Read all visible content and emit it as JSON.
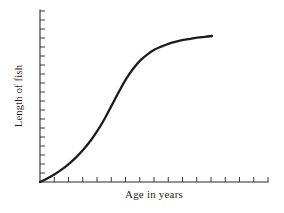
{
  "chart_data": {
    "type": "line",
    "title": "",
    "subtitle": "",
    "xlabel": "Age in years",
    "ylabel": "Length of fish",
    "grid": false,
    "legend": false,
    "legend_position": "none",
    "annotations": [],
    "xlim": [
      0,
      16
    ],
    "ylim": [
      0,
      20
    ],
    "x_tick_labels": [],
    "y_tick_labels": [],
    "x_tick_count": 16,
    "y_tick_count": 19,
    "series": [
      {
        "name": "Length of fish vs age",
        "shape": "sigmoid",
        "x": [
          0,
          0.5,
          1,
          1.5,
          2,
          2.5,
          3,
          3.5,
          4,
          4.5,
          5,
          5.5,
          6,
          6.5,
          7,
          7.5,
          8,
          8.5,
          9,
          9.5,
          10,
          10.5,
          11,
          11.5,
          12
        ],
        "y": [
          0,
          0.45,
          0.95,
          1.55,
          2.25,
          3.05,
          4.0,
          5.1,
          6.4,
          7.9,
          9.6,
          11.3,
          12.9,
          14.2,
          15.25,
          16.0,
          16.6,
          17.0,
          17.35,
          17.6,
          17.8,
          17.95,
          18.1,
          18.2,
          18.3
        ]
      }
    ]
  },
  "labels": {
    "x_axis": "Age in years",
    "y_axis": "Length of fish"
  },
  "colors": {
    "curve": "#1c1c1c",
    "axis": "#2b2b2b",
    "tick": "#3a3a3a",
    "background": "#ffffff",
    "text": "#1f1f1f"
  },
  "geometry": {
    "origin_x": 40,
    "origin_y": 182,
    "x_axis_end": 268,
    "y_axis_top": 10,
    "curve_end_x": 212,
    "curve_end_y": 36,
    "x_tick_spacing": 14.25,
    "y_tick_spacing": 9,
    "x_tick_length": 5,
    "y_tick_length": 5
  }
}
